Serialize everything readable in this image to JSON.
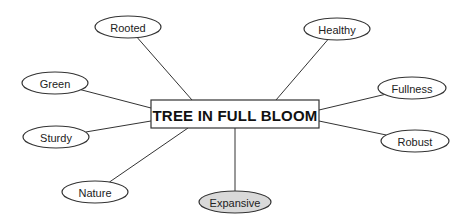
{
  "diagram": {
    "type": "mind-map",
    "center": {
      "label": "TREE IN FULL BLOOM",
      "x": 151,
      "y": 100,
      "width": 168,
      "height": 28,
      "fill": "#ffffff",
      "stroke": "#333333"
    },
    "nodes": [
      {
        "id": "rooted",
        "label": "Rooted",
        "cx": 128,
        "cy": 27,
        "rx": 33,
        "ry": 11,
        "fill": "#ffffff",
        "edge_to": [
          192,
          100
        ]
      },
      {
        "id": "healthy",
        "label": "Healthy",
        "cx": 337,
        "cy": 29,
        "rx": 33,
        "ry": 11,
        "fill": "#ffffff",
        "edge_to": [
          276,
          100
        ]
      },
      {
        "id": "green",
        "label": "Green",
        "cx": 55,
        "cy": 83,
        "rx": 33,
        "ry": 11,
        "fill": "#ffffff",
        "edge_to": [
          151,
          108
        ]
      },
      {
        "id": "fullness",
        "label": "Fullness",
        "cx": 412,
        "cy": 88,
        "rx": 34,
        "ry": 11,
        "fill": "#ffffff",
        "edge_to": [
          319,
          110
        ]
      },
      {
        "id": "sturdy",
        "label": "Sturdy",
        "cx": 56,
        "cy": 137,
        "rx": 33,
        "ry": 11,
        "fill": "#ffffff",
        "edge_to": [
          151,
          121
        ]
      },
      {
        "id": "robust",
        "label": "Robust",
        "cx": 415,
        "cy": 141,
        "rx": 34,
        "ry": 11,
        "fill": "#ffffff",
        "edge_to": [
          319,
          121
        ]
      },
      {
        "id": "nature",
        "label": "Nature",
        "cx": 95,
        "cy": 192,
        "rx": 33,
        "ry": 11,
        "fill": "#ffffff",
        "edge_to": [
          188,
          128
        ]
      },
      {
        "id": "expansive",
        "label": "Expansive",
        "cx": 235,
        "cy": 202,
        "rx": 36,
        "ry": 11,
        "fill": "#d9d9d9",
        "edge_to": [
          235,
          128
        ]
      }
    ],
    "colors": {
      "line": "#333333",
      "highlight_fill": "#d9d9d9",
      "background": "#ffffff"
    }
  }
}
